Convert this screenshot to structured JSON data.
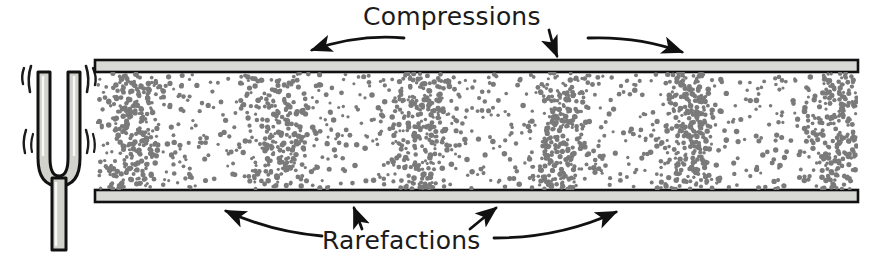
{
  "figure": {
    "title_top": "Compressions",
    "title_bottom": "Rarefactions",
    "colors": {
      "background": "#ffffff",
      "ink": "#1b1b1b",
      "tube_wall_fill": "#d8d8d4",
      "fork_fill": "#d2d2cd",
      "particle": "#7a7a7a"
    }
  },
  "tuning_fork": {
    "name": "tuning-fork",
    "vibration_marks": 8,
    "tines": 2,
    "geometry": {
      "x": 20,
      "y": 62,
      "width": 78,
      "height": 188
    }
  },
  "tube": {
    "name": "air-column-tube",
    "left": 95,
    "right": 858,
    "top_wall_y": 60,
    "bottom_wall_y": 190,
    "wall_thickness": 12
  },
  "wave": {
    "type": "longitudinal",
    "compression_count": 6,
    "compression_x": [
      135,
      281,
      424,
      561,
      692,
      840
    ],
    "rarefaction_x": [
      208,
      352,
      492,
      626,
      766
    ],
    "wavelength_px": 141,
    "particle_count": 2100
  },
  "arrows": {
    "compressions": [
      {
        "name": "arrow-compression-left",
        "from": [
          404,
          36
        ],
        "to": [
          310,
          50
        ],
        "bend": -18
      },
      {
        "name": "arrow-compression-mid",
        "from": [
          548,
          30
        ],
        "to": [
          561,
          58
        ],
        "bend": 4
      },
      {
        "name": "arrow-compression-right",
        "from": [
          588,
          37
        ],
        "to": [
          684,
          52
        ],
        "bend": -16
      }
    ],
    "rarefactions": [
      {
        "name": "arrow-rarefaction-far-left",
        "from": [
          320,
          236
        ],
        "to": [
          222,
          210
        ],
        "bend": 16
      },
      {
        "name": "arrow-rarefaction-left",
        "from": [
          360,
          228
        ],
        "to": [
          352,
          206
        ],
        "bend": -3
      },
      {
        "name": "arrow-rarefaction-right",
        "from": [
          472,
          228
        ],
        "to": [
          500,
          206
        ],
        "bend": 5
      },
      {
        "name": "arrow-rarefaction-far-right",
        "from": [
          492,
          238
        ],
        "to": [
          620,
          210
        ],
        "bend": 14
      }
    ]
  }
}
